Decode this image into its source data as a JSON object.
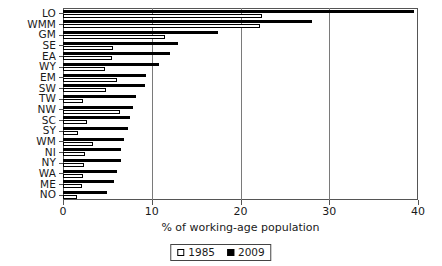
{
  "chart_data": {
    "type": "bar",
    "orientation": "horizontal",
    "title": "",
    "xlabel": "% of working-age population",
    "ylabel": "",
    "xlim": [
      0,
      40
    ],
    "xticks": [
      0,
      10,
      20,
      30,
      40
    ],
    "xtick_labels": [
      "0",
      "10",
      "20",
      "30",
      "40"
    ],
    "grid": "vertical",
    "legend_position": "bottom-center",
    "categories": [
      "LO",
      "WMM",
      "GM",
      "SE",
      "EA",
      "WY",
      "EM",
      "SW",
      "TW",
      "NW",
      "SC",
      "SY",
      "WM",
      "NI",
      "NY",
      "WA",
      "ME",
      "NO"
    ],
    "series": [
      {
        "name": "1985",
        "color": "#ffffff",
        "edge_color": "#000000",
        "values": [
          22.4,
          22.2,
          11.5,
          5.6,
          5.5,
          4.7,
          6.1,
          4.9,
          2.2,
          6.4,
          2.7,
          1.7,
          3.4,
          2.5,
          2.4,
          2.2,
          2.1,
          1.6
        ]
      },
      {
        "name": "2009",
        "color": "#000000",
        "edge_color": "#000000",
        "values": [
          39.6,
          28.0,
          17.5,
          13.0,
          12.1,
          10.8,
          9.4,
          9.2,
          8.2,
          7.9,
          7.5,
          7.3,
          6.9,
          6.5,
          6.5,
          6.1,
          5.8,
          5.0
        ]
      }
    ]
  },
  "legend": {
    "items": [
      {
        "label": "1985",
        "marker": "open-square-icon"
      },
      {
        "label": "2009",
        "marker": "filled-square-icon"
      }
    ]
  },
  "axis": {
    "x_title": "% of working-age population"
  }
}
